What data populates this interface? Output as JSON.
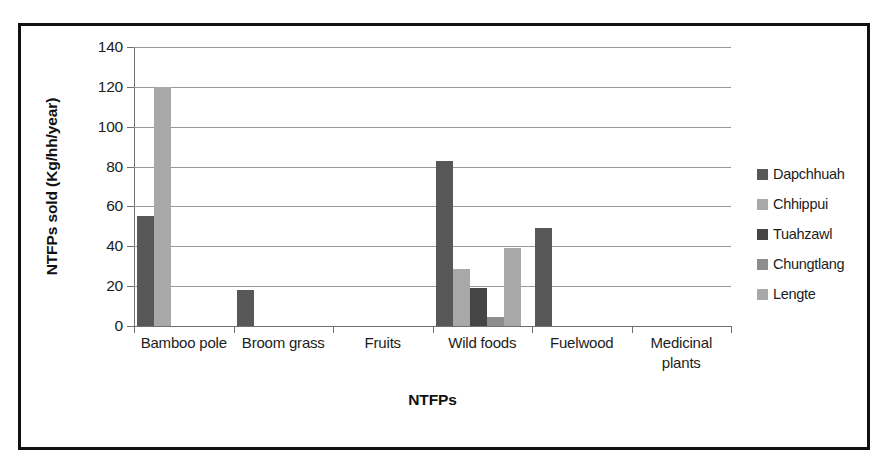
{
  "chart_data": {
    "type": "bar",
    "title": "",
    "xlabel": "NTFPs",
    "ylabel": "NTFPs sold (Kg/hh/year)",
    "ylim": [
      0,
      140
    ],
    "ytick_step": 20,
    "yticks": [
      140,
      120,
      100,
      80,
      60,
      40,
      20,
      0
    ],
    "grid": true,
    "legend_position": "right",
    "categories": [
      "Bamboo pole",
      "Broom grass",
      "Fruits",
      "Wild foods",
      "Fuelwood",
      "Medicinal plants"
    ],
    "series": [
      {
        "name": "Dapchhuah",
        "color": "#575757",
        "values": [
          55,
          18,
          0,
          83,
          49,
          0
        ]
      },
      {
        "name": "Chhippui",
        "color": "#a8a8a8",
        "values": [
          120,
          0,
          0,
          28.5,
          0,
          0
        ]
      },
      {
        "name": "Tuahzawl",
        "color": "#454545",
        "values": [
          0,
          0,
          0,
          19,
          0,
          0
        ]
      },
      {
        "name": "Chungtlang",
        "color": "#8d8d8d",
        "values": [
          0,
          0,
          0,
          4.5,
          0,
          0
        ]
      },
      {
        "name": "Lengte",
        "color": "#a8a8a8",
        "values": [
          0,
          0,
          0,
          39,
          0,
          0
        ]
      }
    ]
  },
  "colors": {
    "frame_border": "#111111",
    "gridline": "#9a9a9a",
    "axis": "#6f6f6f",
    "text": "#1d1d1d",
    "background": "#ffffff"
  }
}
